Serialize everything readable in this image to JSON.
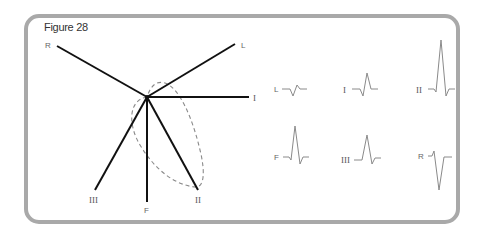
{
  "figure": {
    "title": "Figure 28"
  },
  "axes": [
    {
      "name": "R",
      "label": "R",
      "x2": 57,
      "y2": 46
    },
    {
      "name": "L",
      "label": "L",
      "x2": 235,
      "y2": 44
    },
    {
      "name": "I",
      "label": "I",
      "x2": 249,
      "y2": 97
    },
    {
      "name": "II",
      "label": "II",
      "x2": 198,
      "y2": 190
    },
    {
      "name": "F",
      "label": "F",
      "x2": 147,
      "y2": 202
    },
    {
      "name": "III",
      "label": "III",
      "x2": 95,
      "y2": 190
    }
  ],
  "hub": {
    "x": 147,
    "y": 97
  },
  "vector_loop": {
    "style": "dashed",
    "color": "#888888"
  },
  "waveforms": [
    {
      "lead": "L",
      "label": "L",
      "row": 1,
      "col": 1,
      "description": "small biphasic, negative then small positive"
    },
    {
      "lead": "I",
      "label": "I",
      "row": 1,
      "col": 2,
      "description": "moderate positive R wave"
    },
    {
      "lead": "II",
      "label": "II",
      "row": 1,
      "col": 3,
      "description": "tall positive R wave"
    },
    {
      "lead": "F",
      "label": "F",
      "row": 2,
      "col": 1,
      "description": "tall positive R wave"
    },
    {
      "lead": "III",
      "label": "III",
      "row": 2,
      "col": 2,
      "description": "moderate positive R wave"
    },
    {
      "lead": "R",
      "label": "R",
      "row": 2,
      "col": 3,
      "description": "deep negative QS wave"
    }
  ],
  "colors": {
    "frame": "#a9a9a9",
    "axis_lines": "#111111",
    "waveform": "#8a8a8a",
    "loop": "#888888"
  }
}
